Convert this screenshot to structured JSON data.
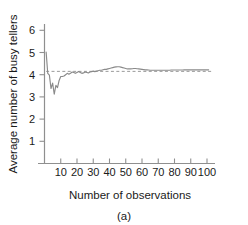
{
  "figure": {
    "caption": "(a)"
  },
  "chart_data": {
    "type": "line",
    "title": "",
    "xlabel": "Number of observations",
    "ylabel": "Average number of busy tellers",
    "xlim": [
      0,
      105
    ],
    "ylim": [
      0,
      6.6
    ],
    "xticks": [
      10,
      20,
      30,
      40,
      50,
      60,
      70,
      80,
      90,
      100
    ],
    "xtick_labels": [
      "10",
      "20",
      "30",
      "40",
      "50",
      "60",
      "70",
      "80",
      "90",
      "100"
    ],
    "yticks": [
      1,
      2,
      3,
      4,
      5,
      6
    ],
    "ytick_labels": [
      "1",
      "2",
      "3",
      "4",
      "5",
      "6"
    ],
    "grid": false,
    "legend": false,
    "line_color": "#8a8a8a",
    "reference_line": {
      "value": 4.15,
      "style": "dashed",
      "color": "#9a9a9a",
      "x_start": 1,
      "x_end": 103
    },
    "series": [
      {
        "name": "Average number of busy tellers",
        "x": [
          1,
          2,
          3,
          4,
          5,
          6,
          7,
          8,
          9,
          10,
          11,
          12,
          13,
          14,
          15,
          16,
          17,
          18,
          19,
          20,
          21,
          22,
          23,
          24,
          25,
          26,
          27,
          28,
          29,
          30,
          31,
          32,
          33,
          34,
          35,
          36,
          37,
          38,
          39,
          40,
          41,
          42,
          43,
          44,
          45,
          46,
          47,
          48,
          49,
          50,
          51,
          52,
          53,
          54,
          55,
          56,
          57,
          58,
          59,
          60,
          61,
          62,
          63,
          64,
          65,
          66,
          67,
          68,
          69,
          70,
          71,
          72,
          73,
          74,
          75,
          76,
          77,
          78,
          79,
          80,
          81,
          82,
          83,
          84,
          85,
          86,
          87,
          88,
          89,
          90,
          91,
          92,
          93,
          94,
          95,
          96,
          97,
          98,
          99,
          100,
          101
        ],
        "y": [
          5.02,
          4.06,
          3.98,
          3.38,
          3.62,
          3.12,
          3.52,
          3.42,
          3.74,
          3.92,
          3.92,
          3.94,
          4.0,
          4.06,
          4.02,
          4.06,
          4.12,
          4.1,
          4.06,
          4.1,
          4.14,
          4.1,
          4.06,
          4.08,
          4.12,
          4.1,
          4.08,
          4.12,
          4.14,
          4.16,
          4.14,
          4.16,
          4.18,
          4.2,
          4.2,
          4.22,
          4.24,
          4.24,
          4.26,
          4.28,
          4.3,
          4.32,
          4.34,
          4.35,
          4.36,
          4.36,
          4.34,
          4.32,
          4.3,
          4.28,
          4.26,
          4.26,
          4.26,
          4.27,
          4.28,
          4.28,
          4.27,
          4.26,
          4.25,
          4.24,
          4.23,
          4.22,
          4.22,
          4.21,
          4.2,
          4.2,
          4.2,
          4.2,
          4.2,
          4.2,
          4.2,
          4.2,
          4.2,
          4.2,
          4.2,
          4.2,
          4.2,
          4.21,
          4.21,
          4.21,
          4.21,
          4.21,
          4.21,
          4.21,
          4.21,
          4.22,
          4.22,
          4.22,
          4.22,
          4.22,
          4.22,
          4.22,
          4.22,
          4.22,
          4.22,
          4.22,
          4.22,
          4.22,
          4.22,
          4.22,
          4.22
        ]
      }
    ]
  }
}
